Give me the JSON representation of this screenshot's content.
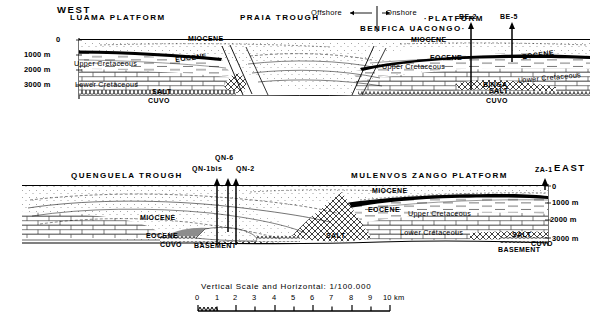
{
  "figure": {
    "orientation_left": "WEST",
    "orientation_right": "EAST"
  },
  "offshore_onshore": {
    "offshore_label": "Offshore",
    "onshore_label": "Onshore",
    "offshore_arrow": "←",
    "onshore_arrow": "→"
  },
  "top_section": {
    "features": [
      {
        "name": "LUAMA PLATFORM",
        "x": 120,
        "y": 18
      },
      {
        "name": "PRAIA TROUGH",
        "x": 268,
        "y": 18
      },
      {
        "name": "BENFICA UACONGO·",
        "x": 386,
        "y": 27
      },
      {
        "name": "·PLATFORM",
        "x": 432,
        "y": 17
      }
    ],
    "wells": [
      {
        "name": "BE-2",
        "x": 471,
        "label_y": 16,
        "top_y": 24,
        "bottom_y": 90
      },
      {
        "name": "BE-5",
        "x": 512,
        "label_y": 16,
        "top_y": 24,
        "bottom_y": 90
      }
    ],
    "depth_axis": {
      "side": "left",
      "ticks": [
        "0",
        "1000 m",
        "2000 m",
        "3000 m"
      ],
      "tick_y": [
        41,
        53,
        68,
        83
      ]
    },
    "strat_labels": [
      {
        "text": "MIOCENE",
        "x": 188,
        "y": 37,
        "style": "caps"
      },
      {
        "text": "MIOCENE",
        "x": 411,
        "y": 38,
        "style": "caps"
      },
      {
        "text": "EOCENE",
        "x": 175,
        "y": 56,
        "style": "caps"
      },
      {
        "text": "EOCENE",
        "x": 430,
        "y": 56,
        "style": "caps"
      },
      {
        "text": "EOCENE",
        "x": 525,
        "y": 53,
        "style": "caps"
      },
      {
        "text": "Upper Cretaceous",
        "x": 74,
        "y": 62,
        "style": "mixed"
      },
      {
        "text": "Upper Cretaceous",
        "x": 388,
        "y": 65,
        "style": "mixed"
      },
      {
        "text": "Lower Cretaceous",
        "x": 75,
        "y": 83,
        "style": "mixed"
      },
      {
        "text": "Lower Cretaceous",
        "x": 522,
        "y": 76,
        "style": "mixed"
      },
      {
        "text": "SALT",
        "x": 157,
        "y": 90,
        "style": "caps"
      },
      {
        "text": "BINGA",
        "x": 487,
        "y": 83,
        "style": "caps"
      },
      {
        "text": "SALT",
        "x": 492,
        "y": 89,
        "style": "caps"
      },
      {
        "text": "CUVO",
        "x": 152,
        "y": 99,
        "style": "caps"
      },
      {
        "text": "CUVO",
        "x": 489,
        "y": 99,
        "style": "caps"
      }
    ]
  },
  "bottom_section": {
    "features": [
      {
        "name": "QUENGUELA TROUGH",
        "x": 80,
        "y": 177
      },
      {
        "name": "MULENVOS ZANGO PLATFORM",
        "x": 380,
        "y": 177
      }
    ],
    "wells": [
      {
        "name": "QN-1bis",
        "x": 217,
        "label_y": 166,
        "top_y": 180,
        "bottom_y": 245
      },
      {
        "name": "QN-6",
        "x": 228,
        "label_y": 156,
        "top_y": 180,
        "bottom_y": 232
      },
      {
        "name": "QN-2",
        "x": 236,
        "label_y": 166,
        "top_y": 180,
        "bottom_y": 245
      },
      {
        "name": "ZA-1",
        "x": 545,
        "label_y": 166,
        "top_y": 180,
        "bottom_y": 188
      }
    ],
    "depth_axis": {
      "side": "right",
      "ticks": [
        "0",
        "1000 m",
        "2000 m",
        "3000 m"
      ],
      "tick_y": [
        186,
        202,
        219,
        238
      ]
    },
    "strat_labels": [
      {
        "text": "MIOCENE",
        "x": 155,
        "y": 216,
        "style": "caps"
      },
      {
        "text": "MIOCENE",
        "x": 381,
        "y": 189,
        "style": "caps"
      },
      {
        "text": "EOCENE",
        "x": 148,
        "y": 234,
        "style": "caps"
      },
      {
        "text": "EOCENE",
        "x": 378,
        "y": 208,
        "style": "caps"
      },
      {
        "text": "Upper Cretaceous",
        "x": 412,
        "y": 212,
        "style": "mixed"
      },
      {
        "text": "Lower Cretaceous",
        "x": 406,
        "y": 231,
        "style": "mixed"
      },
      {
        "text": "SALT",
        "x": 330,
        "y": 234,
        "style": "caps"
      },
      {
        "text": "SALT",
        "x": 518,
        "y": 233,
        "style": "caps"
      },
      {
        "text": "CUVO",
        "x": 163,
        "y": 243,
        "style": "caps"
      },
      {
        "text": "CUVO",
        "x": 537,
        "y": 242,
        "style": "caps"
      },
      {
        "text": "BASEMENT",
        "x": 198,
        "y": 244,
        "style": "caps"
      },
      {
        "text": "BASEMENT",
        "x": 505,
        "y": 248,
        "style": "caps"
      }
    ]
  },
  "scale": {
    "caption": "Vertical Scale and Horizontal: 1/100.000",
    "ticks": [
      "0",
      "1",
      "2",
      "3",
      "4",
      "5",
      "6",
      "7",
      "8",
      "9"
    ],
    "end_label": "10 km",
    "x_start": 198,
    "x_end": 390
  },
  "colors": {
    "ink": "#000000",
    "paper": "#ffffff",
    "hatch": "#1a1a1a"
  }
}
